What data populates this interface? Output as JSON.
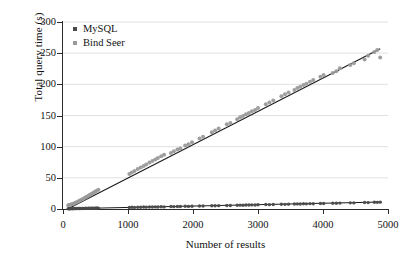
{
  "chart_data": {
    "type": "scatter",
    "title": "",
    "xlabel": "Number of results",
    "ylabel": "Total query time (s)",
    "xlim": [
      0,
      5000
    ],
    "ylim": [
      0,
      300
    ],
    "xticks": [
      0,
      1000,
      2000,
      3000,
      4000,
      5000
    ],
    "yticks": [
      0,
      50,
      100,
      150,
      200,
      250,
      300
    ],
    "grid": "horizontal",
    "legend_position": "top-left-inside",
    "colors": {
      "mysql_marker": "#4a4a4a",
      "bindseer_marker": "#9a9a9a",
      "trendline": "#1a1a1a",
      "gridline": "#d9d9d9",
      "axis": "#2b2b2b",
      "background": "#ffffff"
    },
    "series": [
      {
        "name": "MySQL",
        "marker": "circle",
        "color": "#4a4a4a",
        "trend_slope_per_result": 0.00224,
        "trend_intercept": 0.3,
        "points": [
          [
            80,
            0.4
          ],
          [
            95,
            0.5
          ],
          [
            110,
            0.4
          ],
          [
            130,
            0.6
          ],
          [
            150,
            0.5
          ],
          [
            170,
            0.7
          ],
          [
            190,
            0.6
          ],
          [
            210,
            0.8
          ],
          [
            235,
            0.7
          ],
          [
            255,
            0.9
          ],
          [
            275,
            0.8
          ],
          [
            300,
            1.0
          ],
          [
            320,
            0.9
          ],
          [
            345,
            1.1
          ],
          [
            365,
            1.0
          ],
          [
            390,
            1.2
          ],
          [
            410,
            1.1
          ],
          [
            435,
            1.3
          ],
          [
            455,
            1.2
          ],
          [
            480,
            1.4
          ],
          [
            500,
            1.3
          ],
          [
            520,
            1.5
          ],
          [
            545,
            1.4
          ],
          [
            1020,
            2.5
          ],
          [
            1060,
            2.7
          ],
          [
            1100,
            2.6
          ],
          [
            1150,
            2.9
          ],
          [
            1195,
            2.8
          ],
          [
            1240,
            3.1
          ],
          [
            1280,
            3.0
          ],
          [
            1330,
            3.2
          ],
          [
            1375,
            3.1
          ],
          [
            1420,
            3.4
          ],
          [
            1460,
            3.3
          ],
          [
            1510,
            3.5
          ],
          [
            1555,
            3.4
          ],
          [
            1660,
            3.9
          ],
          [
            1705,
            3.8
          ],
          [
            1760,
            4.1
          ],
          [
            1805,
            4.0
          ],
          [
            1880,
            4.3
          ],
          [
            1930,
            4.2
          ],
          [
            1985,
            4.5
          ],
          [
            2100,
            4.8
          ],
          [
            2155,
            4.7
          ],
          [
            2290,
            5.2
          ],
          [
            2340,
            5.1
          ],
          [
            2395,
            5.4
          ],
          [
            2520,
            5.7
          ],
          [
            2575,
            5.6
          ],
          [
            2680,
            6.0
          ],
          [
            2725,
            6.2
          ],
          [
            2770,
            6.1
          ],
          [
            2815,
            6.4
          ],
          [
            2860,
            6.3
          ],
          [
            2905,
            6.6
          ],
          [
            2955,
            6.5
          ],
          [
            3000,
            6.8
          ],
          [
            3120,
            7.1
          ],
          [
            3175,
            7.0
          ],
          [
            3235,
            7.3
          ],
          [
            3360,
            7.6
          ],
          [
            3415,
            7.5
          ],
          [
            3470,
            7.8
          ],
          [
            3560,
            8.0
          ],
          [
            3605,
            8.2
          ],
          [
            3650,
            8.1
          ],
          [
            3700,
            8.4
          ],
          [
            3745,
            8.3
          ],
          [
            3800,
            8.6
          ],
          [
            3850,
            8.5
          ],
          [
            3960,
            8.9
          ],
          [
            4010,
            8.8
          ],
          [
            4150,
            9.3
          ],
          [
            4205,
            9.2
          ],
          [
            4260,
            9.5
          ],
          [
            4420,
            9.9
          ],
          [
            4475,
            9.8
          ],
          [
            4640,
            10.4
          ],
          [
            4695,
            10.3
          ],
          [
            4790,
            10.8
          ],
          [
            4835,
            10.7
          ],
          [
            4880,
            11.0
          ]
        ]
      },
      {
        "name": "Bind Seer",
        "marker": "circle",
        "color": "#9a9a9a",
        "trend_slope_per_result": 0.0525,
        "trend_intercept": 1.0,
        "points": [
          [
            80,
            6.0
          ],
          [
            95,
            6.5
          ],
          [
            110,
            7.0
          ],
          [
            130,
            7.6
          ],
          [
            150,
            8.2
          ],
          [
            170,
            9.0
          ],
          [
            190,
            10.0
          ],
          [
            210,
            11.0
          ],
          [
            235,
            12.2
          ],
          [
            255,
            13.2
          ],
          [
            275,
            14.4
          ],
          [
            300,
            15.8
          ],
          [
            320,
            17.0
          ],
          [
            345,
            18.6
          ],
          [
            365,
            19.8
          ],
          [
            390,
            21.4
          ],
          [
            410,
            22.6
          ],
          [
            435,
            24.2
          ],
          [
            455,
            25.4
          ],
          [
            480,
            27.0
          ],
          [
            500,
            28.2
          ],
          [
            520,
            29.4
          ],
          [
            545,
            31.0
          ],
          [
            1020,
            56.0
          ],
          [
            1060,
            58.5
          ],
          [
            1100,
            61.0
          ],
          [
            1150,
            64.0
          ],
          [
            1195,
            66.5
          ],
          [
            1240,
            69.0
          ],
          [
            1280,
            71.5
          ],
          [
            1330,
            74.5
          ],
          [
            1375,
            77.0
          ],
          [
            1420,
            79.5
          ],
          [
            1460,
            82.0
          ],
          [
            1510,
            84.5
          ],
          [
            1555,
            87.0
          ],
          [
            1660,
            90.0
          ],
          [
            1705,
            92.5
          ],
          [
            1760,
            95.5
          ],
          [
            1805,
            97.0
          ],
          [
            1880,
            102.0
          ],
          [
            1930,
            104.0
          ],
          [
            1985,
            107.0
          ],
          [
            2100,
            113.0
          ],
          [
            2155,
            116.0
          ],
          [
            2290,
            123.0
          ],
          [
            2340,
            126.0
          ],
          [
            2395,
            129.0
          ],
          [
            2520,
            136.0
          ],
          [
            2575,
            138.0
          ],
          [
            2680,
            144.0
          ],
          [
            2725,
            147.0
          ],
          [
            2770,
            149.0
          ],
          [
            2815,
            152.0
          ],
          [
            2860,
            154.0
          ],
          [
            2905,
            157.0
          ],
          [
            2955,
            159.0
          ],
          [
            3000,
            162.0
          ],
          [
            3120,
            168.0
          ],
          [
            3175,
            171.0
          ],
          [
            3235,
            174.0
          ],
          [
            3360,
            181.0
          ],
          [
            3415,
            184.0
          ],
          [
            3470,
            187.0
          ],
          [
            3560,
            191.0
          ],
          [
            3605,
            194.0
          ],
          [
            3650,
            196.0
          ],
          [
            3700,
            199.0
          ],
          [
            3745,
            201.0
          ],
          [
            3800,
            204.0
          ],
          [
            3850,
            207.0
          ],
          [
            3960,
            212.0
          ],
          [
            4010,
            215.0
          ],
          [
            4150,
            218.0
          ],
          [
            4205,
            221.0
          ],
          [
            4260,
            226.0
          ],
          [
            4420,
            231.0
          ],
          [
            4475,
            234.0
          ],
          [
            4640,
            240.0
          ],
          [
            4695,
            246.0
          ],
          [
            4790,
            252.0
          ],
          [
            4835,
            255.0
          ],
          [
            4880,
            243.0
          ]
        ]
      }
    ],
    "trendlines": [
      {
        "name": "MySQL trend",
        "from": [
          60,
          0.3
        ],
        "to": [
          4900,
          11.2
        ]
      },
      {
        "name": "Bind Seer trend",
        "from": [
          100,
          1.5
        ],
        "to": [
          4880,
          257.0
        ]
      }
    ],
    "legend": [
      {
        "label": "MySQL",
        "color": "#4a4a4a"
      },
      {
        "label": "Bind Seer",
        "color": "#9a9a9a"
      }
    ]
  }
}
